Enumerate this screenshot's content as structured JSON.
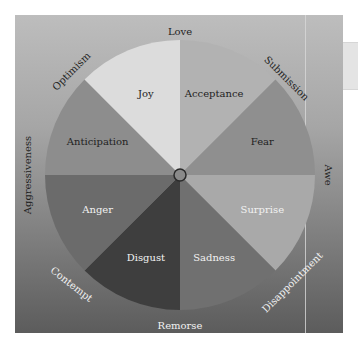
{
  "diagram": {
    "center": {
      "x": 180,
      "y": 175,
      "radius": 135
    },
    "primary_emotions": [
      {
        "label": "Acceptance",
        "color": "#b2b2b2",
        "text_color": "#222222"
      },
      {
        "label": "Fear",
        "color": "#8f8f8f",
        "text_color": "#222222"
      },
      {
        "label": "Surprise",
        "color": "#a9a9a9",
        "text_color": "#f2f2f2"
      },
      {
        "label": "Sadness",
        "color": "#707070",
        "text_color": "#f2f2f2"
      },
      {
        "label": "Disgust",
        "color": "#3e3e3e",
        "text_color": "#f2f2f2"
      },
      {
        "label": "Anger",
        "color": "#6b6b6b",
        "text_color": "#f2f2f2"
      },
      {
        "label": "Anticipation",
        "color": "#8d8d8d",
        "text_color": "#222222"
      },
      {
        "label": "Joy",
        "color": "#dcdcdc",
        "text_color": "#222222"
      }
    ],
    "dyads": [
      {
        "label": "Love",
        "text_color": "#222222"
      },
      {
        "label": "Submission",
        "text_color": "#222222"
      },
      {
        "label": "Awe",
        "text_color": "#222222"
      },
      {
        "label": "Disappointment",
        "text_color": "#f2f2f2"
      },
      {
        "label": "Remorse",
        "text_color": "#f2f2f2"
      },
      {
        "label": "Contempt",
        "text_color": "#f2f2f2"
      },
      {
        "label": "Aggressiveness",
        "text_color": "#222222"
      },
      {
        "label": "Optimism",
        "text_color": "#222222"
      }
    ]
  }
}
